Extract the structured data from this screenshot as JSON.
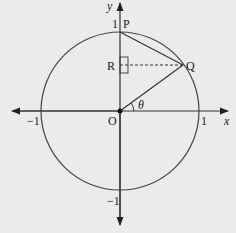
{
  "diagram": {
    "type": "unit-circle",
    "axes": {
      "x_label": "x",
      "y_label": "y"
    },
    "ticks": {
      "x_neg": "−1",
      "x_pos": "1",
      "y_pos": "1",
      "y_neg": "−1"
    },
    "points": {
      "origin": "O",
      "P": "P",
      "Q": "Q",
      "R": "R"
    },
    "angle_label": "θ",
    "colors": {
      "stroke": "#333333",
      "background": "#ebebeb"
    }
  }
}
